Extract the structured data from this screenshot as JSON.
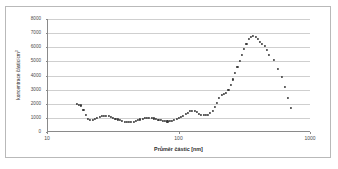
{
  "chart_data": {
    "type": "scatter",
    "title": "",
    "xlabel": "Průměr částic [nm]",
    "ylabel": "koncentrace částic/cm³",
    "ylabel_base": "koncentrace částic/cm",
    "ylabel_sup": "3",
    "xscale": "log",
    "yscale": "linear",
    "xlim": [
      10,
      1000
    ],
    "ylim": [
      0,
      8000
    ],
    "grid": "horizontal",
    "legend": "none",
    "marker_color": "#3a3a3a",
    "gridline_color": "#cfcfcf",
    "axis_color": "#8a8a8a",
    "xticks": [
      10,
      100,
      1000
    ],
    "xtick_labels": [
      "10",
      "100",
      "1000"
    ],
    "yticks": [
      0,
      1000,
      2000,
      3000,
      4000,
      5000,
      6000,
      7000,
      8000
    ],
    "ytick_labels": [
      "0",
      "1000",
      "2000",
      "3000",
      "4000",
      "5000",
      "6000",
      "7000",
      "8000"
    ],
    "x": [
      16.5,
      17.2,
      17.9,
      18.6,
      19.4,
      20.2,
      21.0,
      21.9,
      22.8,
      23.7,
      24.7,
      25.7,
      26.7,
      27.8,
      28.9,
      30.1,
      31.3,
      32.6,
      33.9,
      35.3,
      36.7,
      38.2,
      39.7,
      41.3,
      43.0,
      44.7,
      46.5,
      48.4,
      50.4,
      52.4,
      54.5,
      56.7,
      59.0,
      61.4,
      63.9,
      66.5,
      69.2,
      72.0,
      74.9,
      77.9,
      81.0,
      84.3,
      87.7,
      91.2,
      94.9,
      98.7,
      102.7,
      106.8,
      111.1,
      115.6,
      120.3,
      125.1,
      130.2,
      135.4,
      140.9,
      146.6,
      152.5,
      158.6,
      165.0,
      171.7,
      178.6,
      185.8,
      193.3,
      201.1,
      209.2,
      217.7,
      226.5,
      235.6,
      245.1,
      255.0,
      265.3,
      276.0,
      287.1,
      298.7,
      310.7,
      323.2,
      336.2,
      349.8,
      363.9,
      378.6,
      393.8,
      409.7,
      426.2,
      443.4,
      461.3,
      480.0,
      520.0,
      565.0,
      600.0,
      635.0,
      670.0,
      700.0
    ],
    "y": [
      1960,
      1940,
      1880,
      1560,
      1180,
      940,
      860,
      880,
      930,
      1000,
      1070,
      1120,
      1150,
      1150,
      1120,
      1070,
      1010,
      950,
      890,
      830,
      770,
      720,
      690,
      680,
      700,
      740,
      790,
      840,
      890,
      930,
      970,
      990,
      1000,
      990,
      960,
      920,
      880,
      840,
      800,
      770,
      750,
      760,
      790,
      840,
      900,
      970,
      1050,
      1140,
      1250,
      1370,
      1470,
      1510,
      1480,
      1400,
      1300,
      1230,
      1180,
      1180,
      1230,
      1330,
      1500,
      1760,
      2080,
      2420,
      2620,
      2680,
      2780,
      3000,
      3320,
      3720,
      4150,
      4600,
      5050,
      5480,
      5880,
      6250,
      6560,
      6740,
      6780,
      6700,
      6560,
      6400,
      6240,
      6080,
      5820,
      5450,
      5080,
      4480,
      3880,
      3200,
      2420,
      1720,
      1230,
      820
    ]
  }
}
